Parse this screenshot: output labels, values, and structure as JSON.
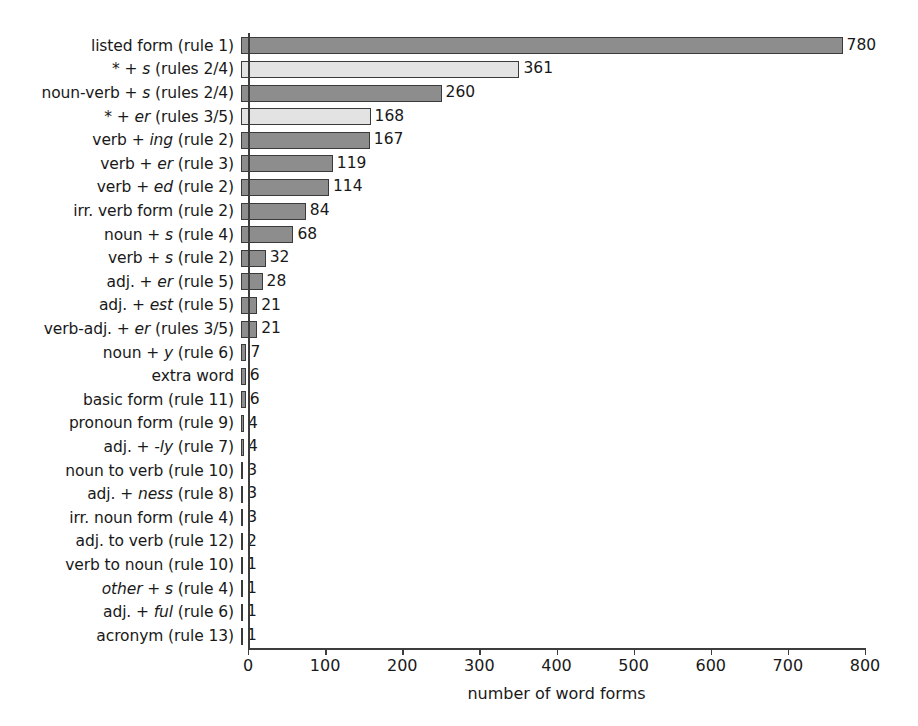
{
  "chart_data": {
    "type": "bar",
    "orientation": "horizontal",
    "title": "",
    "xlabel": "number of word forms",
    "ylabel": "",
    "xlim": [
      0,
      800
    ],
    "xticks": [
      0,
      100,
      200,
      300,
      400,
      500,
      600,
      700,
      800
    ],
    "grid": false,
    "legend": null,
    "categories": [
      "listed form (rule 1)",
      "* + s (rules 2/4)",
      "noun-verb + s (rules 2/4)",
      "* + er (rules 3/5)",
      "verb + ing (rule 2)",
      "verb + er (rule 3)",
      "verb + ed (rule 2)",
      "irr. verb form (rule 2)",
      "noun + s (rule 4)",
      "verb + s (rule 2)",
      "adj. + er (rule 5)",
      "adj. + est (rule 5)",
      "verb-adj. + er (rules 3/5)",
      "noun + y (rule 6)",
      "extra word",
      "basic form (rule 11)",
      "pronoun form (rule 9)",
      "adj. + -ly (rule 7)",
      "noun to verb (rule 10)",
      "adj. + ness (rule 8)",
      "irr. noun form (rule 4)",
      "adj. to verb (rule 12)",
      "verb to noun (rule 10)",
      "other + s (rule 4)",
      "adj. + ful (rule 6)",
      "acronym (rule 13)"
    ],
    "values": [
      780,
      361,
      260,
      168,
      167,
      119,
      114,
      84,
      68,
      32,
      28,
      21,
      21,
      7,
      6,
      6,
      4,
      4,
      3,
      3,
      3,
      2,
      1,
      1,
      1,
      1
    ],
    "bar_styles": [
      "dark",
      "light",
      "dark",
      "light",
      "dark",
      "dark",
      "dark",
      "dark",
      "dark",
      "dark",
      "dark",
      "dark",
      "dark",
      "dark",
      "dark",
      "dark",
      "dark",
      "dark",
      "dark",
      "dark",
      "dark",
      "dark",
      "dark",
      "dark",
      "dark",
      "dark"
    ],
    "colors": {
      "dark": "#8d8d8d",
      "light": "#e3e3e3",
      "bar_border": "#3a3a3a",
      "axis": "#3d3d3d",
      "text": "#191919",
      "background": "#ffffff"
    },
    "category_label_html": [
      "listed form (rule 1)",
      "* + <i>s</i> (rules 2/4)",
      "noun-verb + <i>s</i> (rules 2/4)",
      "* + <i>er</i> (rules 3/5)",
      "verb + <i>ing</i> (rule 2)",
      "verb + <i>er</i> (rule 3)",
      "verb + <i>ed</i> (rule 2)",
      "irr. verb form (rule 2)",
      "noun + <i>s</i> (rule 4)",
      "verb + <i>s</i> (rule 2)",
      "adj. + <i>er</i> (rule 5)",
      "adj. + <i>est</i> (rule 5)",
      "verb-adj. + <i>er</i> (rules 3/5)",
      "noun + <i>y</i> (rule 6)",
      "extra word",
      "basic form (rule 11)",
      "pronoun form (rule 9)",
      "adj. + <i>-ly</i> (rule 7)",
      "noun to verb (rule 10)",
      "adj. + <i>ness</i> (rule 8)",
      "irr. noun form (rule 4)",
      "adj. to verb (rule 12)",
      "verb to noun (rule 10)",
      "<i>other</i> + <i>s</i> (rule 4)",
      "adj. + <i>ful</i> (rule 6)",
      "acronym (rule 13)"
    ],
    "value_labels": [
      "780",
      "361",
      "260",
      "168",
      "167",
      "119",
      "114",
      "84",
      "68",
      "32",
      "28",
      "21",
      "21",
      "7",
      "6",
      "6",
      "4",
      "4",
      "3",
      "3",
      "3",
      "2",
      "1",
      "1",
      "1",
      "1"
    ]
  }
}
